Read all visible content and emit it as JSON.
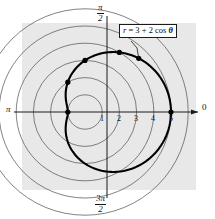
{
  "figure": {
    "panel": {
      "x": 22,
      "y": 23,
      "width": 174,
      "height": 167,
      "fill": "#e8e8e8"
    },
    "colors": {
      "background": "#ffffff",
      "panel": "#e8e8e8",
      "grid": "#4d4d4d",
      "axis": "#1a1a1a",
      "curve": "#000000",
      "point": "#000000",
      "text": "#141414",
      "callout_border": "#1a1a1a",
      "callout_fill": "#ffffff"
    },
    "equation_label": {
      "text": "r = 3 + 2 cos θ",
      "parts": {
        "r": "r",
        "equals": " = ",
        "three": "3",
        "plus": " + ",
        "two": "2",
        "cos": " cos ",
        "theta": "θ"
      }
    },
    "axis_labels": {
      "right": "0",
      "left": "π",
      "top_numerator": "π",
      "top_denominator": "2",
      "bottom_numerator": "3π",
      "bottom_denominator": "2"
    },
    "tick_labels": [
      "1",
      "2",
      "3",
      "4",
      "5"
    ]
  },
  "chart_data": {
    "type": "line",
    "plot_kind": "polar",
    "title": "r = 3 + 2 cos θ",
    "equation": "r = 3 + 2*cos(theta)",
    "curve_name": "limacon",
    "xlabel": "",
    "ylabel": "",
    "theta_range_deg": [
      0,
      360
    ],
    "r_max_grid": 6,
    "grid": true,
    "grid_circle_radii": [
      1,
      2,
      3,
      4,
      5,
      6
    ],
    "radial_tick_labels": [
      "1",
      "2",
      "3",
      "4",
      "5"
    ],
    "radial_tick_values": [
      1,
      2,
      3,
      4,
      5
    ],
    "angular_tick_labels": [
      "0",
      "π/2",
      "π",
      "3π/2"
    ],
    "angular_tick_values_deg": [
      0,
      90,
      180,
      270
    ],
    "legend_position": "none",
    "annotations": [
      {
        "text": "r = 3 + 2 cos θ",
        "kind": "callout-box",
        "points_to_theta_deg": 45
      }
    ],
    "marked_points": [
      {
        "theta_deg": 0,
        "theta_label": "0",
        "r": 5
      },
      {
        "theta_deg": 60,
        "theta_label": "π/3",
        "r": 4
      },
      {
        "theta_deg": 90,
        "theta_label": "π/2",
        "r": 3
      },
      {
        "theta_deg": 120,
        "theta_label": "2π/3",
        "r": 2
      },
      {
        "theta_deg": 180,
        "theta_label": "π",
        "r": 1
      },
      {
        "theta_deg": 45,
        "theta_label": "π/4",
        "r": 4.414
      }
    ],
    "series": [
      {
        "name": "r = 3 + 2 cos θ",
        "theta_deg": [
          0,
          15,
          30,
          45,
          60,
          75,
          90,
          105,
          120,
          135,
          150,
          165,
          180,
          195,
          210,
          225,
          240,
          255,
          270,
          285,
          300,
          315,
          330,
          345,
          360
        ],
        "r": [
          5.0,
          4.932,
          4.732,
          4.414,
          4.0,
          3.518,
          3.0,
          2.482,
          2.0,
          1.586,
          1.268,
          1.068,
          1.0,
          1.068,
          1.268,
          1.586,
          2.0,
          2.482,
          3.0,
          3.518,
          4.0,
          4.414,
          4.732,
          4.932,
          5.0
        ]
      }
    ]
  }
}
